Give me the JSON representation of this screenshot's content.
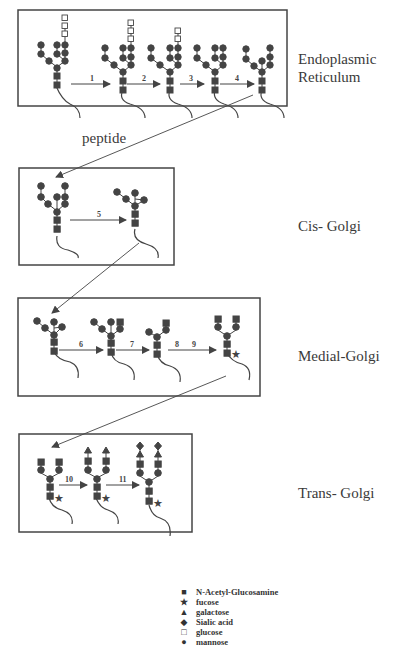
{
  "compartments": [
    {
      "id": "er",
      "label": "Endoplasmic\nReticulum",
      "steps": [
        "1",
        "2",
        "3",
        "4"
      ]
    },
    {
      "id": "cis",
      "label": "Cis- Golgi",
      "steps": [
        "5"
      ]
    },
    {
      "id": "medial",
      "label": "Medial-Golgi",
      "steps": [
        "6",
        "7",
        "8",
        "9"
      ]
    },
    {
      "id": "trans",
      "label": "Trans- Golgi",
      "steps": [
        "10",
        "11"
      ]
    }
  ],
  "annotations": {
    "peptide": "peptide"
  },
  "legend": [
    {
      "symbol": "square-filled",
      "glyph": "■",
      "label": "N-Acetyl-Glucosamine"
    },
    {
      "symbol": "star",
      "glyph": "★",
      "label": "fucose"
    },
    {
      "symbol": "triangle",
      "glyph": "▲",
      "label": "galactose"
    },
    {
      "symbol": "diamond",
      "glyph": "◆",
      "label": "Sialic acid"
    },
    {
      "symbol": "square-open",
      "glyph": "□",
      "label": "glucose"
    },
    {
      "symbol": "circle",
      "glyph": "●",
      "label": "mannose"
    }
  ],
  "colors": {
    "ink": "#3a3a3a",
    "border": "#444444",
    "background": "#ffffff"
  }
}
